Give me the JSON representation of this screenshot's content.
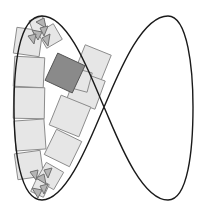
{
  "figure": {
    "colors": {
      "background": "#ffffff",
      "curve": "#1a1a1a",
      "square_fill": "#e6e6e6",
      "square_stroke": "#8c8c8c",
      "highlight_fill": "#8a8a8a",
      "highlight_stroke": "#555555",
      "shard_fill": "#b5b5b5",
      "shard_stroke": "#707070"
    },
    "square_count": 14,
    "highlighted_square_count": 1,
    "shard_clusters": 2
  }
}
